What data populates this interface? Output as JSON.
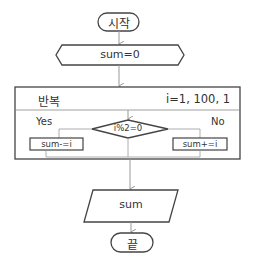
{
  "flowchart": {
    "start": {
      "label": "시작"
    },
    "init": {
      "label": "sum=0"
    },
    "loop": {
      "label": "반복",
      "range": "i=1, 100, 1"
    },
    "decision": {
      "label": "i%2=0"
    },
    "yes_branch": {
      "label": "Yes",
      "action": "sum-=i"
    },
    "no_branch": {
      "label": "No",
      "action": "sum+=i"
    },
    "output": {
      "label": "sum"
    },
    "end": {
      "label": "끝"
    }
  },
  "colors": {
    "stroke": "#444444",
    "connector": "#999999",
    "background": "#ffffff"
  }
}
